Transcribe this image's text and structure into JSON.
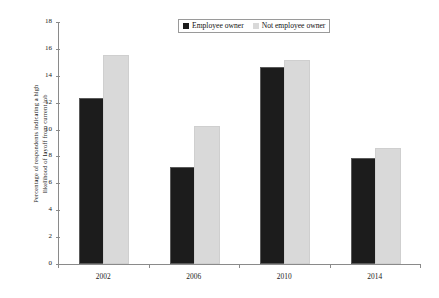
{
  "chart_data": {
    "type": "bar",
    "title": "",
    "xlabel": "",
    "ylabel": "Percentage of respondents indicating  a high likelihood of layoff from current job",
    "ylabel_lines": [
      "Percentage of respondents indicating  a high",
      "likelihood of layoff from current job"
    ],
    "categories": [
      "2002",
      "2006",
      "2010",
      "2014"
    ],
    "series": [
      {
        "name": "Employee owner",
        "color": "#1c1c1c",
        "values": [
          12.2,
          7.1,
          14.5,
          7.7
        ]
      },
      {
        "name": "Not employee owner",
        "color": "#d9d9d9",
        "values": [
          15.4,
          10.1,
          15.0,
          8.5
        ]
      }
    ],
    "ylim": [
      0,
      18
    ],
    "ytick_values": [
      0,
      2,
      4,
      6,
      8,
      10,
      12,
      14,
      16,
      18
    ],
    "ytick_labels": [
      "0",
      "2",
      "4",
      "6",
      "8",
      "10",
      "12",
      "14",
      "16",
      "18"
    ],
    "grid": false,
    "legend_position": "top-center"
  },
  "legend": {
    "items": [
      {
        "label": "Employee owner",
        "swatch": "black-square-icon"
      },
      {
        "label": "Not employee owner",
        "swatch": "light-gray-square-icon"
      }
    ]
  }
}
